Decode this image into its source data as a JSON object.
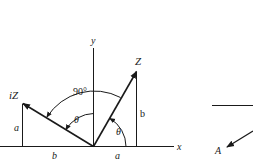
{
  "diagram": {
    "title": "",
    "axes": {
      "x_label": "x",
      "y_label": "y"
    },
    "vectors": [
      {
        "name": "Z",
        "label": "Z",
        "components": {
          "horizontal": "a",
          "vertical": "b"
        }
      },
      {
        "name": "iZ",
        "label": "iZ",
        "components": {
          "horizontal": "b",
          "vertical": "a"
        }
      }
    ],
    "labels": {
      "z": "Z",
      "iz": "iZ",
      "z_vertical": "b",
      "z_horizontal": "a",
      "iz_vertical": "a",
      "iz_horizontal": "b",
      "right_angle": "90°",
      "theta_z": "θ",
      "theta_iz": "θ"
    },
    "fragment": {
      "label": "A"
    },
    "colors": {
      "line": "#1a1a1a",
      "background": "#ffffff"
    }
  }
}
